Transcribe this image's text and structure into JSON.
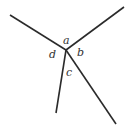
{
  "diagram": {
    "type": "angle-junction",
    "vertex": {
      "x": 66,
      "y": 50
    },
    "rays": [
      {
        "name": "upper-left",
        "end": {
          "x": 10,
          "y": 15
        }
      },
      {
        "name": "upper-right",
        "end": {
          "x": 124,
          "y": 7
        }
      },
      {
        "name": "lower-left",
        "end": {
          "x": 56,
          "y": 113
        }
      },
      {
        "name": "lower-right",
        "end": {
          "x": 116,
          "y": 124
        }
      }
    ],
    "angle_labels": {
      "a": "a",
      "b": "b",
      "c": "c",
      "d": "d"
    },
    "line_color": "#2b2b2b",
    "label_color": "#333333"
  }
}
